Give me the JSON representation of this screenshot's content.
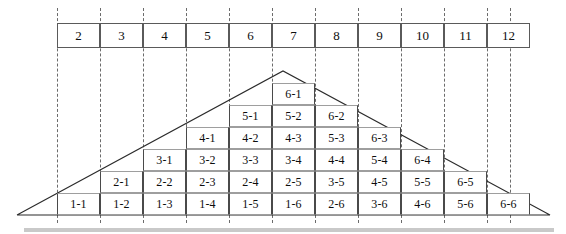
{
  "figure": {
    "colors": {
      "cell_border_vertical": "#4a4a4a",
      "cell_border_horizontal": "#9e9e9e",
      "box_border": "#5a5a5a",
      "guide_line": "#6b6b6b",
      "triangle_line": "#2b2b2b",
      "text": "#0d0d0d",
      "background": "#ffffff",
      "bottom_band": "#c9c9c9"
    },
    "geometry": {
      "column_width": 43,
      "column_start_x": 57,
      "column_count": 11,
      "row_height": 22,
      "baseline_y": 215,
      "triangle_left_apex": [
        17,
        215
      ],
      "triangle_top_apex": [
        283,
        71
      ],
      "triangle_right_apex": [
        550,
        215
      ]
    }
  },
  "sum_boxes": [
    {
      "label": "2",
      "column": 0
    },
    {
      "label": "3",
      "column": 1
    },
    {
      "label": "4",
      "column": 2
    },
    {
      "label": "5",
      "column": 3
    },
    {
      "label": "6",
      "column": 4
    },
    {
      "label": "7",
      "column": 5
    },
    {
      "label": "8",
      "column": 6
    },
    {
      "label": "9",
      "column": 7
    },
    {
      "label": "10",
      "column": 8
    },
    {
      "label": "11",
      "column": 9
    },
    {
      "label": "12",
      "column": 10
    }
  ],
  "guide_lines": [
    57,
    100,
    143,
    186,
    229,
    272,
    315,
    358,
    401,
    444,
    487,
    510
  ],
  "columns": [
    {
      "sum": 2,
      "column": 0,
      "count": 1,
      "cells": [
        "1-1"
      ]
    },
    {
      "sum": 3,
      "column": 1,
      "count": 2,
      "cells": [
        "1-2",
        "2-1"
      ]
    },
    {
      "sum": 4,
      "column": 2,
      "count": 3,
      "cells": [
        "1-3",
        "2-2",
        "3-1"
      ]
    },
    {
      "sum": 5,
      "column": 3,
      "count": 4,
      "cells": [
        "1-4",
        "2-3",
        "3-2",
        "4-1"
      ]
    },
    {
      "sum": 6,
      "column": 4,
      "count": 5,
      "cells": [
        "1-5",
        "2-4",
        "3-3",
        "4-2",
        "5-1"
      ]
    },
    {
      "sum": 7,
      "column": 5,
      "count": 6,
      "cells": [
        "1-6",
        "2-5",
        "3-4",
        "4-3",
        "5-2",
        "6-1"
      ]
    },
    {
      "sum": 8,
      "column": 6,
      "count": 5,
      "cells": [
        "2-6",
        "3-5",
        "4-4",
        "5-3",
        "6-2"
      ]
    },
    {
      "sum": 9,
      "column": 7,
      "count": 4,
      "cells": [
        "3-6",
        "4-5",
        "5-4",
        "6-3"
      ]
    },
    {
      "sum": 10,
      "column": 8,
      "count": 3,
      "cells": [
        "4-6",
        "5-5",
        "6-4"
      ]
    },
    {
      "sum": 11,
      "column": 9,
      "count": 2,
      "cells": [
        "5-6",
        "6-5"
      ]
    },
    {
      "sum": 12,
      "column": 10,
      "count": 1,
      "cells": [
        "6-6"
      ]
    }
  ]
}
